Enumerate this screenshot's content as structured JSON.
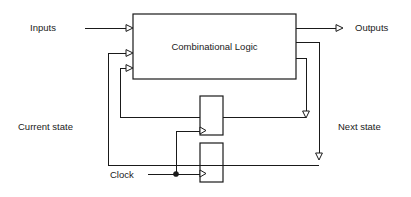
{
  "diagram": {
    "type": "block-diagram",
    "canvas": {
      "width": 411,
      "height": 197,
      "background": "#ffffff"
    },
    "line_color": "#1a1a1a",
    "blocks": [
      {
        "id": "combinational-logic",
        "label": "Combinational Logic",
        "x": 133,
        "y": 14,
        "width": 163,
        "height": 65
      },
      {
        "id": "flip-flop-upper",
        "label": "",
        "x": 200,
        "y": 96,
        "width": 23,
        "height": 39
      },
      {
        "id": "flip-flop-lower",
        "label": "",
        "x": 200,
        "y": 143,
        "width": 23,
        "height": 39
      }
    ],
    "labels": {
      "inputs": "Inputs",
      "outputs": "Outputs",
      "current_state": "Current state",
      "next_state": "Next state",
      "clock": "Clock",
      "combinational_logic": "Combinational Logic"
    }
  }
}
